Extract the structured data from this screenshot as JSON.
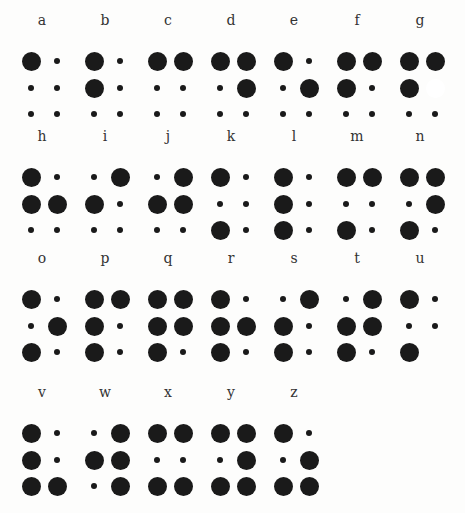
{
  "chart": {
    "title": "",
    "cells": [
      {
        "letter": "a",
        "dots": [
          1
        ],
        "col": 0,
        "row": 0
      },
      {
        "letter": "b",
        "dots": [
          1,
          2
        ],
        "col": 1,
        "row": 0
      },
      {
        "letter": "c",
        "dots": [
          1,
          4
        ],
        "col": 2,
        "row": 0
      },
      {
        "letter": "d",
        "dots": [
          1,
          4,
          5
        ],
        "col": 3,
        "row": 0
      },
      {
        "letter": "e",
        "dots": [
          1,
          5
        ],
        "col": 4,
        "row": 0
      },
      {
        "letter": "f",
        "dots": [
          1,
          2,
          4
        ],
        "col": 5,
        "row": 0
      },
      {
        "letter": "g",
        "dots": [
          1,
          2,
          4
        ],
        "blank": [
          5
        ],
        "col": 6,
        "row": 0
      },
      {
        "letter": "h",
        "dots": [
          1,
          2,
          5
        ],
        "col": 0,
        "row": 1
      },
      {
        "letter": "i",
        "dots": [
          2,
          4
        ],
        "col": 1,
        "row": 1
      },
      {
        "letter": "j",
        "dots": [
          2,
          4,
          5
        ],
        "col": 2,
        "row": 1
      },
      {
        "letter": "k",
        "dots": [
          1,
          3
        ],
        "col": 3,
        "row": 1
      },
      {
        "letter": "l",
        "dots": [
          1,
          2,
          3
        ],
        "col": 4,
        "row": 1
      },
      {
        "letter": "m",
        "dots": [
          1,
          3,
          4
        ],
        "col": 5,
        "row": 1
      },
      {
        "letter": "n",
        "dots": [
          1,
          3,
          4,
          5
        ],
        "col": 6,
        "row": 1
      },
      {
        "letter": "o",
        "dots": [
          1,
          3,
          5
        ],
        "col": 0,
        "row": 2
      },
      {
        "letter": "p",
        "dots": [
          1,
          2,
          3,
          4
        ],
        "col": 1,
        "row": 2
      },
      {
        "letter": "q",
        "dots": [
          1,
          2,
          3,
          4,
          5
        ],
        "col": 2,
        "row": 2
      },
      {
        "letter": "r",
        "dots": [
          1,
          2,
          3,
          5
        ],
        "col": 3,
        "row": 2
      },
      {
        "letter": "s",
        "dots": [
          2,
          3,
          4
        ],
        "col": 4,
        "row": 2
      },
      {
        "letter": "t",
        "dots": [
          2,
          3,
          4,
          5
        ],
        "col": 5,
        "row": 2
      },
      {
        "letter": "u",
        "dots": [
          1,
          3
        ],
        "none": [
          6
        ],
        "col": 6,
        "row": 2
      },
      {
        "letter": "v",
        "dots": [
          1,
          2,
          3,
          6
        ],
        "col": 0,
        "row": 3
      },
      {
        "letter": "w",
        "dots": [
          2,
          4,
          5,
          6
        ],
        "col": 1,
        "row": 3
      },
      {
        "letter": "x",
        "dots": [
          1,
          3,
          4,
          6
        ],
        "col": 2,
        "row": 3
      },
      {
        "letter": "y",
        "dots": [
          1,
          3,
          4,
          5,
          6
        ],
        "col": 3,
        "row": 3
      },
      {
        "letter": "z",
        "dots": [
          1,
          3,
          5,
          6
        ],
        "col": 4,
        "row": 3
      }
    ]
  },
  "layout": {
    "col_x": [
      20,
      83,
      146,
      209,
      272,
      335,
      398
    ],
    "row_y": [
      12,
      128,
      250,
      384
    ]
  }
}
